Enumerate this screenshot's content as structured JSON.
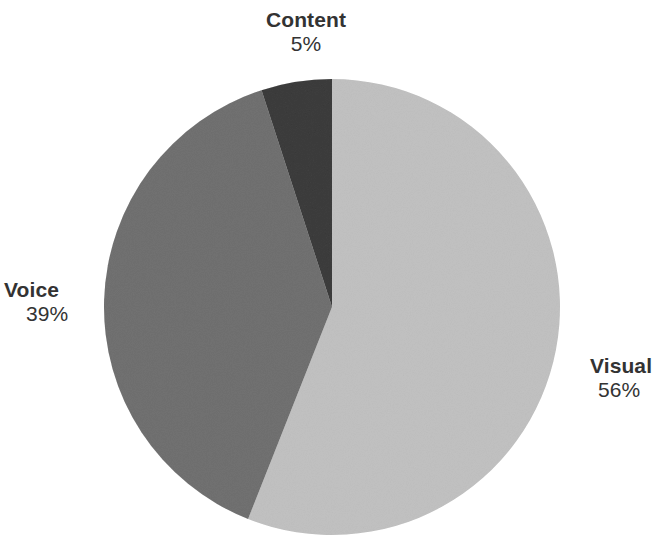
{
  "chart_data": {
    "type": "pie",
    "title": "",
    "subtitle": "",
    "xlabel": "",
    "ylabel": "",
    "legend_position": "none",
    "grid": false,
    "labels_outside": true,
    "categories": [
      "Visual",
      "Voice",
      "Content"
    ],
    "values": [
      56,
      39,
      5
    ],
    "value_unit": "%",
    "start_angle_deg": 0,
    "direction": "clockwise",
    "center": {
      "cx": 332,
      "cy": 307,
      "r": 228
    },
    "slices": [
      {
        "name": "Visual",
        "value": 56,
        "value_label": "56%",
        "color": "#dedede",
        "start_deg": 0,
        "end_deg": 201.6,
        "label_side": "right"
      },
      {
        "name": "Voice",
        "value": 39,
        "value_label": "39%",
        "color": "#a9a9a9",
        "start_deg": 201.6,
        "end_deg": 342,
        "label_side": "left"
      },
      {
        "name": "Content",
        "value": 5,
        "value_label": "5%",
        "color": "#7c7c7c",
        "start_deg": 342,
        "end_deg": 360,
        "label_side": "top"
      }
    ]
  },
  "labels": {
    "content": {
      "name": "Content",
      "value": "5%"
    },
    "voice": {
      "name": "Voice",
      "value": "39%"
    },
    "visual": {
      "name": "Visual",
      "value": "56%"
    }
  },
  "colors": {
    "background": "#ffffff",
    "text": "#333333",
    "visual_slice": "#dedede",
    "voice_slice": "#a9a9a9",
    "content_slice": "#7c7c7c"
  }
}
